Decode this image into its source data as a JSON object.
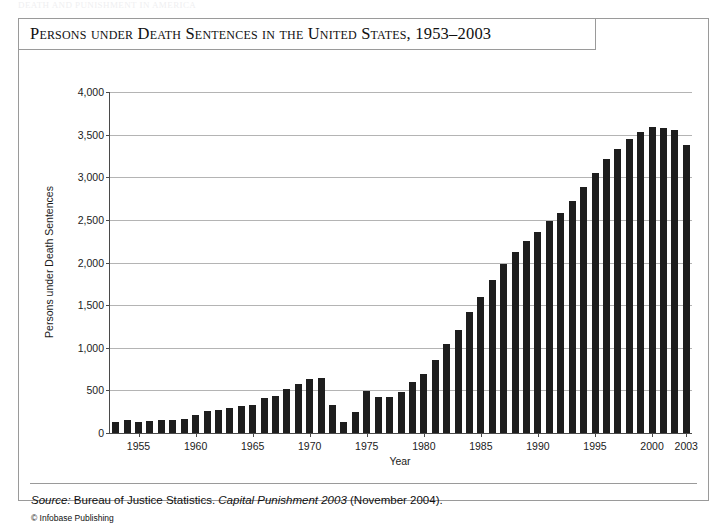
{
  "page": {
    "ghost_header": "DEATH AND PUNISHMENT IN AMERICA"
  },
  "figure": {
    "title": "Persons under Death Sentences in the United States, 1953–2003",
    "source_label": "Source:",
    "source_text_1": " Bureau of Justice Statistics. ",
    "source_italic": "Capital Punishment 2003",
    "source_text_2": " (November 2004).",
    "credit": "© Infobase Publishing"
  },
  "chart_data": {
    "type": "bar",
    "title": "Persons under Death Sentences in the United States, 1953–2003",
    "xlabel": "Year",
    "ylabel": "Persons under Death Sentences",
    "ylim": [
      0,
      4000
    ],
    "ytick_values": [
      0,
      500,
      1000,
      1500,
      2000,
      2500,
      3000,
      3500,
      4000
    ],
    "ytick_labels": [
      "0",
      "500",
      "1,000",
      "1,500",
      "2,000",
      "2,500",
      "3,000",
      "3,500",
      "4,000"
    ],
    "xtick_labels": [
      "1955",
      "1960",
      "1965",
      "1970",
      "1975",
      "1980",
      "1985",
      "1990",
      "1995",
      "2000",
      "2003"
    ],
    "grid": true,
    "legend": false,
    "bar_color": "#1e1e1e",
    "categories": [
      1953,
      1954,
      1955,
      1956,
      1957,
      1958,
      1959,
      1960,
      1961,
      1962,
      1963,
      1964,
      1965,
      1966,
      1967,
      1968,
      1969,
      1970,
      1971,
      1972,
      1973,
      1974,
      1975,
      1976,
      1977,
      1978,
      1979,
      1980,
      1981,
      1982,
      1983,
      1984,
      1985,
      1986,
      1987,
      1988,
      1989,
      1990,
      1991,
      1992,
      1993,
      1994,
      1995,
      1996,
      1997,
      1998,
      1999,
      2000,
      2001,
      2002,
      2003
    ],
    "values": [
      131,
      147,
      125,
      146,
      151,
      147,
      164,
      212,
      257,
      267,
      297,
      315,
      331,
      406,
      435,
      517,
      575,
      631,
      642,
      334,
      134,
      244,
      488,
      420,
      423,
      482,
      593,
      691,
      860,
      1050,
      1209,
      1420,
      1591,
      1800,
      1984,
      2124,
      2250,
      2356,
      2482,
      2575,
      2716,
      2890,
      3054,
      3219,
      3335,
      3452,
      3527,
      3593,
      3577,
      3557,
      3374
    ]
  }
}
